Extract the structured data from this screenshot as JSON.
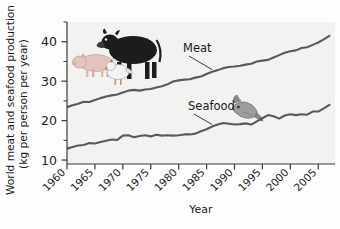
{
  "chart_data": {
    "type": "line",
    "title": "",
    "xlabel": "Year",
    "ylabel": "World meat and seafood production (kg per person per year)",
    "ylabel_line1": "World meat and seafood production",
    "ylabel_line2": "(kg per person per year)",
    "xlim": [
      1960,
      2008
    ],
    "ylim": [
      9,
      45
    ],
    "grid": false,
    "legend_position": "inline-annotations",
    "x_major_ticks": [
      1960,
      1965,
      1970,
      1975,
      1980,
      1985,
      1990,
      1995,
      2000,
      2005
    ],
    "x_tick_labels": [
      "1960",
      "1965",
      "1970",
      "1975",
      "1980",
      "1985",
      "1990",
      "1995",
      "2000",
      "2005"
    ],
    "y_major_ticks": [
      10,
      20,
      30,
      40
    ],
    "y_tick_labels": [
      "10",
      "20",
      "30",
      "40"
    ],
    "y_minor_ticks": [
      15,
      25,
      35,
      45
    ],
    "units": "kg per person per year",
    "x": [
      1960,
      1961,
      1962,
      1963,
      1964,
      1965,
      1966,
      1967,
      1968,
      1969,
      1970,
      1971,
      1972,
      1973,
      1974,
      1975,
      1976,
      1977,
      1978,
      1979,
      1980,
      1981,
      1982,
      1983,
      1984,
      1985,
      1986,
      1987,
      1988,
      1989,
      1990,
      1991,
      1992,
      1993,
      1994,
      1995,
      1996,
      1997,
      1998,
      1999,
      2000,
      2001,
      2002,
      2003,
      2004,
      2005,
      2006,
      2007
    ],
    "series": [
      {
        "name": "Meat",
        "color": "#595959",
        "label_anchor_year": 1986,
        "values": [
          23.4,
          23.9,
          24.3,
          24.8,
          24.7,
          25.2,
          25.7,
          26.1,
          26.4,
          26.6,
          27.1,
          27.6,
          27.8,
          27.6,
          27.9,
          28.0,
          28.4,
          28.7,
          29.2,
          29.9,
          30.2,
          30.4,
          30.5,
          30.9,
          31.2,
          31.8,
          32.4,
          32.8,
          33.3,
          33.6,
          33.7,
          33.9,
          34.2,
          34.4,
          35.0,
          35.2,
          35.4,
          36.0,
          36.6,
          37.2,
          37.6,
          37.8,
          38.4,
          38.6,
          39.2,
          39.8,
          40.6,
          41.5
        ]
      },
      {
        "name": "Seafood",
        "color": "#595959",
        "label_anchor_year": 1986,
        "values": [
          12.9,
          13.3,
          13.7,
          13.8,
          14.3,
          14.2,
          14.6,
          14.9,
          15.2,
          15.1,
          16.2,
          16.3,
          15.8,
          16.1,
          16.3,
          16.0,
          16.4,
          16.2,
          16.3,
          16.2,
          16.3,
          16.5,
          16.5,
          16.7,
          17.3,
          17.8,
          18.5,
          19.0,
          19.4,
          19.2,
          19.0,
          19.1,
          19.3,
          19.0,
          19.8,
          20.6,
          21.4,
          21.1,
          20.5,
          21.3,
          21.6,
          21.4,
          21.6,
          21.5,
          22.3,
          22.3,
          23.1,
          24.0
        ]
      }
    ],
    "annotations": [
      {
        "text": "Meat",
        "series": "Meat"
      },
      {
        "text": "Seafood",
        "series": "Seafood"
      }
    ],
    "illustrations": [
      {
        "name": "cow-illustration",
        "description": "black cow"
      },
      {
        "name": "pig-illustration",
        "description": "pink pig"
      },
      {
        "name": "chicken-illustration",
        "description": "white chicken"
      },
      {
        "name": "fish-illustration",
        "description": "gray fish"
      }
    ]
  },
  "colors": {
    "line": "#595959",
    "axis": "#3a3a3a",
    "text": "#1a1a1a",
    "plot_background": "#f2f2f0",
    "figure_background": "#fdfdfd",
    "cow": "#1c1c1c",
    "pig": "#e8c9c2",
    "chicken": "#efefef",
    "fish": "#9a9a9a"
  }
}
